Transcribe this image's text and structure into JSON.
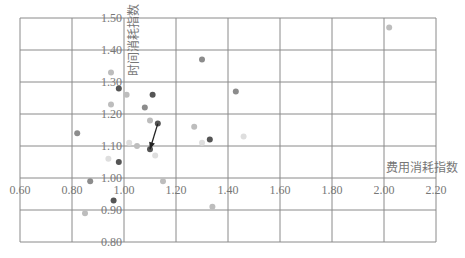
{
  "chart_data": {
    "type": "scatter",
    "title": "",
    "xlabel": "费用消耗指数",
    "ylabel": "时间消耗指数",
    "xlim": [
      0.6,
      2.2
    ],
    "ylim": [
      0.8,
      1.5
    ],
    "grid": true,
    "legend": null,
    "x_ticks": [
      "0.60",
      "0.80",
      "1.00",
      "1.20",
      "1.40",
      "1.60",
      "1.80",
      "2.00",
      "2.20"
    ],
    "y_ticks": [
      "0.80",
      "0.90",
      "1.00",
      "1.10",
      "1.20",
      "1.30",
      "1.40",
      "1.50"
    ],
    "axis_crossing": {
      "x": 1.0,
      "y": 1.0
    },
    "points": [
      {
        "x": 2.02,
        "y": 1.47,
        "shade": "light"
      },
      {
        "x": 1.3,
        "y": 1.37,
        "shade": "medium"
      },
      {
        "x": 1.43,
        "y": 1.27,
        "shade": "medium"
      },
      {
        "x": 0.95,
        "y": 1.33,
        "shade": "light"
      },
      {
        "x": 0.98,
        "y": 1.28,
        "shade": "dark"
      },
      {
        "x": 1.01,
        "y": 1.26,
        "shade": "light"
      },
      {
        "x": 1.11,
        "y": 1.26,
        "shade": "dark"
      },
      {
        "x": 0.95,
        "y": 1.23,
        "shade": "light"
      },
      {
        "x": 1.08,
        "y": 1.22,
        "shade": "medium"
      },
      {
        "x": 1.1,
        "y": 1.18,
        "shade": "light"
      },
      {
        "x": 1.13,
        "y": 1.17,
        "shade": "dark"
      },
      {
        "x": 0.82,
        "y": 1.14,
        "shade": "medium"
      },
      {
        "x": 1.27,
        "y": 1.16,
        "shade": "light"
      },
      {
        "x": 1.33,
        "y": 1.12,
        "shade": "dark"
      },
      {
        "x": 1.3,
        "y": 1.11,
        "shade": "faint"
      },
      {
        "x": 1.02,
        "y": 1.11,
        "shade": "faint"
      },
      {
        "x": 1.05,
        "y": 1.1,
        "shade": "light"
      },
      {
        "x": 1.1,
        "y": 1.09,
        "shade": "dark"
      },
      {
        "x": 0.94,
        "y": 1.06,
        "shade": "faint"
      },
      {
        "x": 0.98,
        "y": 1.05,
        "shade": "dark"
      },
      {
        "x": 1.12,
        "y": 1.07,
        "shade": "faint"
      },
      {
        "x": 0.87,
        "y": 0.99,
        "shade": "medium"
      },
      {
        "x": 1.15,
        "y": 0.99,
        "shade": "light"
      },
      {
        "x": 0.96,
        "y": 0.93,
        "shade": "dark"
      },
      {
        "x": 0.85,
        "y": 0.89,
        "shade": "light"
      },
      {
        "x": 1.34,
        "y": 0.91,
        "shade": "light"
      },
      {
        "x": 1.46,
        "y": 1.13,
        "shade": "faint"
      }
    ],
    "annotations": [
      {
        "type": "arrow",
        "from": {
          "x": 1.13,
          "y": 1.17
        },
        "to": {
          "x": 1.1,
          "y": 1.09
        }
      }
    ]
  },
  "colors": {
    "grid": "#8a8a8a",
    "dark": "#555555",
    "medium": "#8c8c8c",
    "light": "#bdbdbd",
    "faint": "#dedede",
    "text": "#777777"
  }
}
